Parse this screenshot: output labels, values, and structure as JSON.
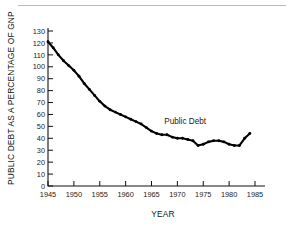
{
  "figure": {
    "background_color": "#ffffff",
    "line_color": "#000000",
    "axis_color": "#111111",
    "rule_color": "#b9b9b9"
  },
  "chart_data": {
    "type": "line",
    "title": "",
    "xlabel": "YEAR",
    "ylabel": "PUBLIC DEBT AS A PERCENTAGE OF GNP",
    "xlim": [
      1945,
      1985
    ],
    "ylim": [
      0,
      130
    ],
    "grid": false,
    "legend": "none",
    "annotations": [
      {
        "text": "Public Debt",
        "x": 1971.5,
        "y": 52
      }
    ],
    "xticks": [
      1945,
      1950,
      1955,
      1960,
      1965,
      1970,
      1975,
      1980,
      1985
    ],
    "xtick_labels": [
      "1945",
      "1950",
      "1955",
      "1960",
      "1965",
      "1970",
      "1975",
      "1980",
      "1985"
    ],
    "yticks": [
      0,
      10,
      20,
      30,
      40,
      50,
      60,
      70,
      80,
      90,
      100,
      110,
      120,
      130
    ],
    "ytick_labels": [
      "0",
      "10",
      "20",
      "30",
      "40",
      "50",
      "60",
      "70",
      "80",
      "90",
      "100",
      "110",
      "120",
      "130"
    ],
    "series": [
      {
        "name": "Public Debt",
        "x": [
          1945,
          1946,
          1947,
          1948,
          1949,
          1950,
          1951,
          1952,
          1953,
          1954,
          1955,
          1956,
          1957,
          1958,
          1959,
          1960,
          1961,
          1962,
          1963,
          1964,
          1965,
          1966,
          1967,
          1968,
          1969,
          1970,
          1971,
          1972,
          1973,
          1974,
          1975,
          1976,
          1977,
          1978,
          1979,
          1980,
          1981,
          1982,
          1983,
          1984
        ],
        "values": [
          121,
          116,
          110,
          105,
          101,
          97,
          92,
          86,
          81,
          76,
          71,
          67,
          64,
          62,
          60,
          58,
          56,
          54,
          52,
          49,
          46,
          44,
          43,
          43,
          41,
          40,
          40,
          39,
          38,
          34,
          35,
          37,
          38,
          38,
          37,
          35,
          34,
          34,
          40,
          44
        ]
      }
    ]
  }
}
